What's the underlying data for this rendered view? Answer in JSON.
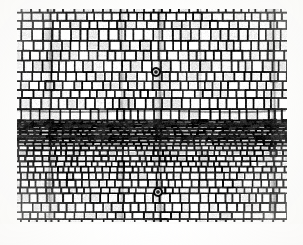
{
  "document": {
    "kind": "photomicrograph",
    "subject": "wood transverse (cross) section",
    "caption": ""
  },
  "plate": {
    "name": "wood-transverse-section-micrograph",
    "frame": {
      "x": 17,
      "y": 9,
      "width": 270,
      "height": 213
    },
    "page_background": "#fdfdfc",
    "tone": {
      "lumen_light": "#f2f1ec",
      "lumen_mid": "#dcdad3",
      "cell_wall_dark": "#1a1a18",
      "cell_wall_mid": "#43423d",
      "background": "#efeeea"
    },
    "magnification_bar": null,
    "labels": []
  },
  "anatomy": {
    "zones": [
      {
        "name": "earlywood-upper",
        "description": "large rounded thin-walled tracheid lumens",
        "y_start": 0,
        "y_end": 101,
        "mean_cell_width": 9.0,
        "mean_cell_height": 9.5,
        "wall_thickness": 1.5,
        "lumen_fill": "#f1f0eb"
      },
      {
        "name": "latewood-band",
        "description": "radially flattened thick-walled cells forming the growth-ring boundary",
        "y_start": 101,
        "y_end": 130,
        "mean_cell_width": 7.0,
        "mean_cell_height": 3.0,
        "wall_thickness": 2.0,
        "lumen_fill": "#cfcdc6"
      },
      {
        "name": "transition",
        "description": "abrupt ring boundary, cells enlarging again",
        "y_start": 130,
        "y_end": 152,
        "mean_cell_width": 7.5,
        "mean_cell_height": 5.0,
        "wall_thickness": 1.7,
        "lumen_fill": "#e4e3dd"
      },
      {
        "name": "earlywood-lower",
        "description": "new growth increment, cells progressively wider",
        "y_start": 152,
        "y_end": 213,
        "mean_cell_width": 8.5,
        "mean_cell_height": 7.5,
        "wall_thickness": 1.5,
        "lumen_fill": "#eeede8"
      }
    ],
    "rays": [
      {
        "name": "ray-1",
        "x": 33,
        "width": 2.4,
        "contrast": 0.55
      },
      {
        "name": "ray-2",
        "x": 105,
        "width": 2.0,
        "contrast": 0.45
      },
      {
        "name": "ray-3",
        "x": 143,
        "width": 2.6,
        "contrast": 0.6
      },
      {
        "name": "ray-4",
        "x": 183,
        "width": 1.8,
        "contrast": 0.4
      },
      {
        "name": "ray-5",
        "x": 257,
        "width": 2.8,
        "contrast": 0.65
      }
    ],
    "resin_canals": [
      {
        "name": "resin-canal-upper",
        "x": 139,
        "y": 63,
        "radius": 4.0
      },
      {
        "name": "resin-canal-lower",
        "x": 141,
        "y": 183,
        "radius": 4.0
      }
    ],
    "ring_boundary_y": 101,
    "row_count_estimate": 34,
    "column_count_estimate": 31
  },
  "render": {
    "seed": 20240417,
    "noise_amount": 0.16,
    "blur_radius": 0.45,
    "contrast": 1.22
  }
}
